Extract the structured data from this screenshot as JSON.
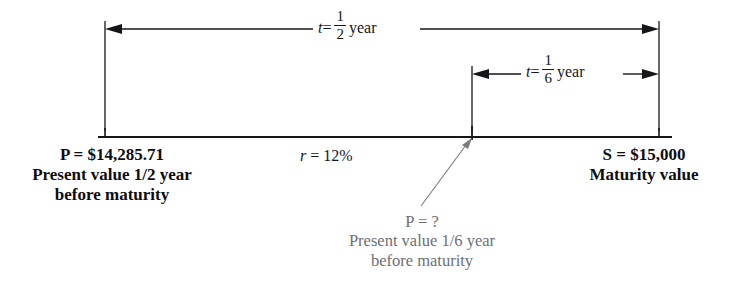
{
  "diagram": {
    "type": "timeline",
    "background_color": "#ffffff",
    "line_color": "#16161a",
    "muted_text_color": "#6e6e74",
    "timeline": {
      "start_label": "P = $14,285.71",
      "end_label": "S = $15,000"
    },
    "spans": [
      {
        "name": "half-year-span",
        "var": "t",
        "equals": "=",
        "numerator": "1",
        "denominator": "2",
        "unit": "year",
        "full_text": "t = 1/2 year"
      },
      {
        "name": "sixth-year-span",
        "var": "t",
        "equals": "=",
        "numerator": "1",
        "denominator": "6",
        "unit": "year",
        "full_text": "t = 1/6 year"
      }
    ],
    "annotations": {
      "present_value": {
        "value_line": "P = $14,285.71",
        "desc_line_1": "Present value 1/2 year",
        "desc_line_2": "before maturity"
      },
      "rate": {
        "symbol": "r",
        "equals": "=",
        "value": "12%",
        "full_text": "r = 12%"
      },
      "maturity": {
        "value_line": "S = $15,000",
        "desc_line_1": "Maturity value"
      },
      "unknown": {
        "value_line": "P = ?",
        "desc_line_1": "Present value 1/6 year",
        "desc_line_2": "before maturity"
      }
    }
  }
}
